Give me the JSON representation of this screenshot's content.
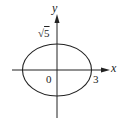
{
  "figure": {
    "type": "ellipse-on-axes",
    "equation_implied": "x^2/9 + y^2/5 = 1",
    "semi_major_axis": 3,
    "semi_minor_axis": "√5",
    "colors": {
      "stroke": "#222222",
      "background": "#ffffff"
    }
  },
  "labels": {
    "x_axis": "x",
    "y_axis": "y",
    "origin": "0",
    "x_intercept": "3",
    "y_intercept_radical": "√",
    "y_intercept_radicand": "5"
  }
}
